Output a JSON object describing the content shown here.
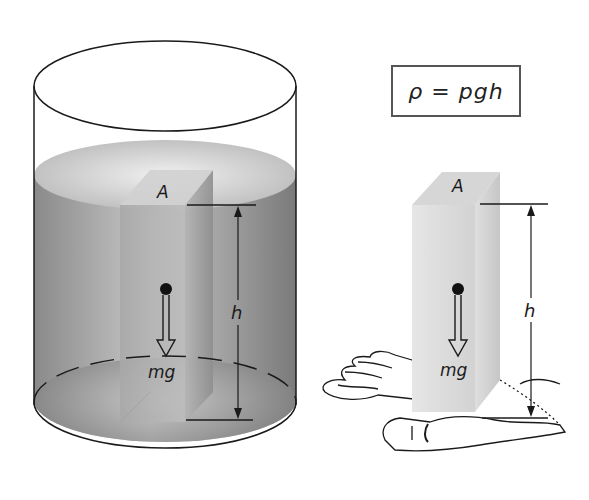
{
  "formula": {
    "text": "ρ = pgh",
    "lhs": "ρ",
    "equals": "=",
    "rhs": "pgh"
  },
  "left_figure": {
    "description": "block of fluid inside a cylindrical container of fluid",
    "area_label": "A",
    "height_label": "h",
    "weight_label": "mg"
  },
  "right_figure": {
    "description": "same block of fluid supported by a hand",
    "area_label": "A",
    "height_label": "h",
    "weight_label": "mg"
  },
  "colors": {
    "outline": "#1a1a1a",
    "fluid_dark": "#7d7d7d",
    "fluid_light": "#d4d4d4",
    "block_light": "#e2e2e2",
    "box_border": "#555555"
  }
}
